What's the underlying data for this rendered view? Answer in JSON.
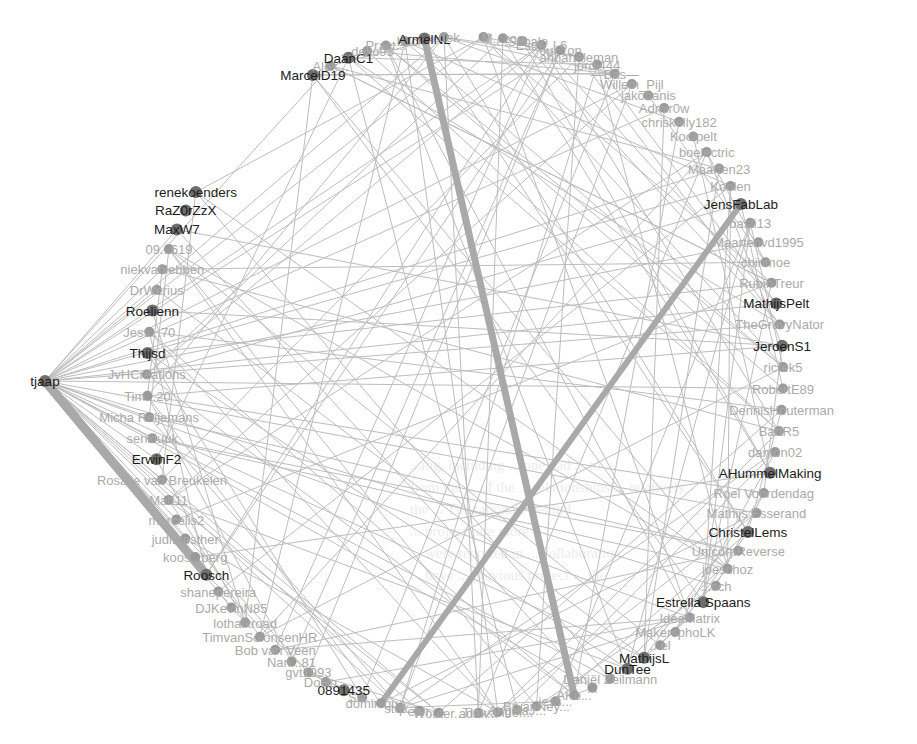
{
  "diagram": {
    "type": "social-network-circular-layout",
    "background_text_lines": [
      "...ing, including ... one had ... to ...",
      "from the ... of the ... relationships ... relatively",
      "the ... The rationale behind",
      "... projects are more",
      "... were reported in ... collaboration",
      "... have ... previous project ... the"
    ],
    "center": {
      "x": 455,
      "y": 375
    },
    "radius": {
      "x": 335,
      "y": 345
    },
    "hub": {
      "id": "tjaap",
      "label": "tjaap",
      "x": 45,
      "y": 381
    },
    "nodes": [
      {
        "label": "MarcelD19",
        "major": true
      },
      {
        "label": "Alex...",
        "major": false
      },
      {
        "label": "DaanC1",
        "major": true
      },
      {
        "label": "...dexo93",
        "major": false
      },
      {
        "label": "Pract...",
        "major": false
      },
      {
        "label": "...buck",
        "major": false
      },
      {
        "label": "ArmelNL",
        "major": true
      },
      {
        "label": "...dek",
        "major": false
      },
      {
        "label": "...l",
        "major": false
      },
      {
        "label": "M...zoo",
        "major": false
      },
      {
        "label": "...Sabalo",
        "major": false
      },
      {
        "label": "Esth...L6",
        "major": false
      },
      {
        "label": "6ui...on",
        "major": false
      },
      {
        "label": "annaheleman",
        "major": false
      },
      {
        "label": "jordi444",
        "major": false
      },
      {
        "label": "—Bas—",
        "major": false
      },
      {
        "label": "Willem_Pijl",
        "major": false
      },
      {
        "label": "jakobanis",
        "major": false
      },
      {
        "label": "Admir0w",
        "major": false
      },
      {
        "label": "chriskelly182",
        "major": false
      },
      {
        "label": "Koolpelt",
        "major": false
      },
      {
        "label": "boelectric",
        "major": false
      },
      {
        "label": "Maarten23",
        "major": false
      },
      {
        "label": "Koolen",
        "major": false
      },
      {
        "label": "JensFabLab",
        "major": true
      },
      {
        "label": "basti13",
        "major": false
      },
      {
        "label": "Maartenvd1995",
        "major": false
      },
      {
        "label": "chinmoe",
        "major": false
      },
      {
        "label": "RubinTreur",
        "major": false
      },
      {
        "label": "MathijsPelt",
        "major": true
      },
      {
        "label": "TheGravyNator",
        "major": false
      },
      {
        "label": "JeroenS1",
        "major": true
      },
      {
        "label": "ricrek5",
        "major": false
      },
      {
        "label": "RobertE89",
        "major": false
      },
      {
        "label": "DennisHouterman",
        "major": false
      },
      {
        "label": "BartR5",
        "major": false
      },
      {
        "label": "damon02",
        "major": false
      },
      {
        "label": "AHummelMaking",
        "major": true
      },
      {
        "label": "Roel Voordendag",
        "major": false
      },
      {
        "label": "Mathijs Esserand",
        "major": false
      },
      {
        "label": "ChristelLems",
        "major": true
      },
      {
        "label": "UnicornReverse",
        "major": false
      },
      {
        "label": "joeschoz",
        "major": false
      },
      {
        "label": "...sch",
        "major": false
      },
      {
        "label": "Estrella Spaans",
        "major": true
      },
      {
        "label": "IdeaMatrix",
        "major": false
      },
      {
        "label": "MakersphoLK",
        "major": false
      },
      {
        "label": "...el",
        "major": false
      },
      {
        "label": "MathijsL",
        "major": true
      },
      {
        "label": "DunTee",
        "major": true
      },
      {
        "label": "Daniël Zeilmann",
        "major": false
      },
      {
        "label": "...",
        "major": false
      },
      {
        "label": "AKo...",
        "major": false
      },
      {
        "label": "jess...",
        "major": false
      },
      {
        "label": "BryanNey...",
        "major": false
      },
      {
        "label": "AngelaJ...",
        "major": false
      },
      {
        "label": "Timvander...",
        "major": false
      },
      {
        "label": "adak...",
        "major": false
      },
      {
        "label": "Wouter...",
        "major": false
      },
      {
        "label": "Peter...",
        "major": false
      },
      {
        "label": "stef...",
        "major": false
      },
      {
        "label": "dominique...",
        "major": false
      },
      {
        "label": "Ssl...",
        "major": false
      },
      {
        "label": "0891435",
        "major": true
      },
      {
        "label": "DoHo...",
        "major": false
      },
      {
        "label": "gvt1993",
        "major": false
      },
      {
        "label": "Nan...81",
        "major": false
      },
      {
        "label": "Bob van Veen",
        "major": false
      },
      {
        "label": "TimvanSolonsenHR",
        "major": false
      },
      {
        "label": "lothalkroad",
        "major": false
      },
      {
        "label": "DJKevinN85",
        "major": false
      },
      {
        "label": "shanepereira",
        "major": false
      },
      {
        "label": "Roosch",
        "major": true
      },
      {
        "label": "koos...berg",
        "major": false
      },
      {
        "label": "judithesther",
        "major": false
      },
      {
        "label": "marcelis2",
        "major": false
      },
      {
        "label": "Matt11",
        "major": false
      },
      {
        "label": "Rosalie van Breukelen",
        "major": false
      },
      {
        "label": "ErwinF2",
        "major": true
      },
      {
        "label": "senkluuk",
        "major": false
      },
      {
        "label": "Micha Reijemans",
        "major": false
      },
      {
        "label": "Tim...20",
        "major": false
      },
      {
        "label": "JvHCreations",
        "major": false
      },
      {
        "label": "Thijsd",
        "major": true
      },
      {
        "label": "Jess...70",
        "major": false
      },
      {
        "label": "Roelienn",
        "major": true
      },
      {
        "label": "DrWerius",
        "major": false
      },
      {
        "label": "niekvanlebben",
        "major": false
      },
      {
        "label": "09...619",
        "major": false
      },
      {
        "label": "MaxW7",
        "major": true
      },
      {
        "label": "RaZ0rZzX",
        "major": true
      },
      {
        "label": "renekoenders",
        "major": true
      }
    ],
    "strong_edges": [
      {
        "from": "tjaap",
        "to": "Roosch",
        "width": 9
      },
      {
        "from": "ArmelNL",
        "to": "AKo...",
        "width": 7
      },
      {
        "from": "JensFabLab",
        "to": "dominique...",
        "width": 6
      }
    ],
    "colors": {
      "edge": "#bdbdbd",
      "strong_edge": "#a9a9a9",
      "node": "#9a9a9a",
      "node_major": "#6e6e6e",
      "label": "#aaaaaa",
      "label_major": "#1c1c1c"
    }
  }
}
